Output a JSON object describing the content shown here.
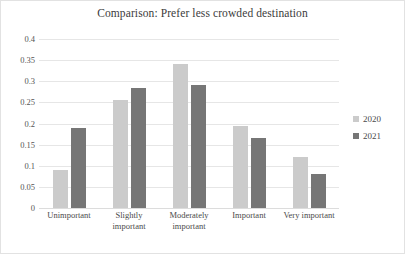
{
  "chart_data": {
    "type": "bar",
    "title": "Comparison: Prefer less crowded destination",
    "xlabel": "",
    "ylabel": "",
    "categories": [
      "Unimportant",
      "Slightly important",
      "Moderately important",
      "Important",
      "Very important"
    ],
    "categories_lines": [
      [
        "Unimportant"
      ],
      [
        "Slightly",
        "important"
      ],
      [
        "Moderately",
        "important"
      ],
      [
        "Important"
      ],
      [
        "Very important"
      ]
    ],
    "series": [
      {
        "name": "2020",
        "color": "#cbcbcb",
        "values": [
          0.09,
          0.255,
          0.34,
          0.195,
          0.12
        ]
      },
      {
        "name": "2021",
        "color": "#767676",
        "values": [
          0.19,
          0.285,
          0.29,
          0.165,
          0.08
        ]
      }
    ],
    "ylim": [
      0,
      0.4
    ],
    "y_ticks": [
      0,
      0.05,
      0.1,
      0.15,
      0.2,
      0.25,
      0.3,
      0.35,
      0.4
    ],
    "y_tick_labels": [
      "0",
      "0.05",
      "0.1",
      "0.15",
      "0.2",
      "0.25",
      "0.3",
      "0.35",
      "0.4"
    ],
    "grid": true,
    "legend_position": "right"
  }
}
